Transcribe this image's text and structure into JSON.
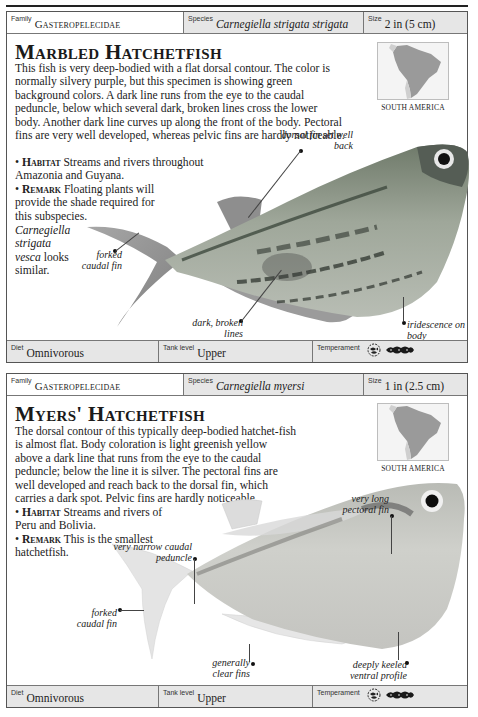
{
  "entries": [
    {
      "family_label": "Family",
      "family": "Gasteropelecidae",
      "species_label": "Species",
      "species": "Carnegiella strigata strigata",
      "size_label": "Size",
      "size": "2 in (5 cm)",
      "title": "Marbled Hatchetfish",
      "description": "This fish is very deep-bodied with a flat dorsal contour. The color is normally silvery purple, but this specimen is showing green background colors. A dark line runs from the eye to the caudal peduncle, below which several dark, broken lines cross the lower body. Another dark line curves up along the front of the body. Pectoral fins are very well developed, whereas pelvic fins are hardly noticeable.",
      "habitat_label": "Habitat",
      "habitat": "Streams and rivers throughout Amazonia and Guyana.",
      "remark_label": "Remark",
      "remark": "Floating plants will provide the shade required for this subspecies.",
      "remark_italic": "Carnegiella strigata vesca",
      "remark_tail": "looks similar.",
      "map_label": "SOUTH AMERICA",
      "callouts": {
        "dorsal": "dorsal fin set well back",
        "caudal": "forked caudal fin",
        "lines": "dark, broken lines",
        "iridescence": "iridescence on body"
      },
      "diet_label": "Diet",
      "diet": "Omnivorous",
      "tank_label": "Tank level",
      "tank": "Upper",
      "temperament_label": "Temperament",
      "temperament_icons": [
        "community-fish-icon",
        "school-of-fish-icon"
      ]
    },
    {
      "family_label": "Family",
      "family": "Gasteropelecidae",
      "species_label": "Species",
      "species": "Carnegiella myersi",
      "size_label": "Size",
      "size": "1 in (2.5 cm)",
      "title": "Myers' Hatchetfish",
      "description": "The dorsal contour of this typically deep-bodied hatchet-fish is almost flat. Body coloration is light greenish yellow above a dark line that runs from the eye to the caudal peduncle; below the line it is silver. The pectoral fins are well developed and reach back to the dorsal fin, which carries a dark spot. Pelvic fins are hardly noticeable.",
      "habitat_label": "Habitat",
      "habitat": "Streams and rivers of Peru and Bolivia.",
      "remark_label": "Remark",
      "remark": "This is the smallest hatchetfish.",
      "map_label": "SOUTH AMERICA",
      "callouts": {
        "pectoral": "very long pectoral fin",
        "peduncle": "very narrow caudal peduncle",
        "caudal": "forked caudal fin",
        "clear": "generally clear fins",
        "keeled": "deeply keeled ventral profile"
      },
      "diet_label": "Diet",
      "diet": "Omnivorous",
      "tank_label": "Tank level",
      "tank": "Upper",
      "temperament_label": "Temperament",
      "temperament_icons": [
        "community-fish-icon",
        "school-of-fish-icon"
      ]
    }
  ]
}
